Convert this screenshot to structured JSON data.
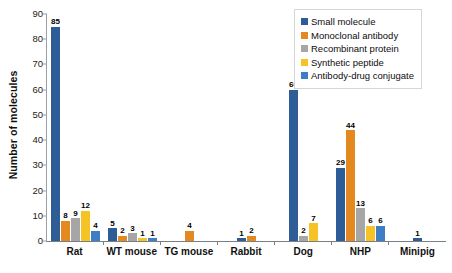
{
  "chart_data": {
    "type": "bar",
    "title": "",
    "xlabel": "",
    "ylabel": "Number of molecules",
    "ylim": [
      0,
      90
    ],
    "yticks": [
      0,
      10,
      20,
      30,
      40,
      50,
      60,
      70,
      80,
      90
    ],
    "grid": false,
    "legend_position": "top-right",
    "categories": [
      "Rat",
      "WT mouse",
      "TG mouse",
      "Rabbit",
      "Dog",
      "NHP",
      "Minipig"
    ],
    "series": [
      {
        "name": "Small molecule",
        "color": "#2e5c96",
        "values": [
          85,
          5,
          null,
          1,
          60,
          29,
          1
        ]
      },
      {
        "name": "Monoclonal antibody",
        "color": "#e3891f",
        "values": [
          8,
          2,
          4,
          2,
          null,
          44,
          null
        ]
      },
      {
        "name": "Recombinant protein",
        "color": "#a6a6a6",
        "values": [
          9,
          3,
          null,
          null,
          2,
          13,
          null
        ]
      },
      {
        "name": "Synthetic peptide",
        "color": "#f5c325",
        "values": [
          12,
          1,
          null,
          null,
          7,
          6,
          null
        ]
      },
      {
        "name": "Antibody-drug conjugate",
        "color": "#3e7ec4",
        "values": [
          4,
          1,
          null,
          null,
          null,
          6,
          null
        ]
      }
    ]
  },
  "legend": {
    "items": [
      {
        "label": "Small molecule",
        "color": "#2e5c96"
      },
      {
        "label": "Monoclonal antibody",
        "color": "#e3891f"
      },
      {
        "label": "Recombinant protein",
        "color": "#a6a6a6"
      },
      {
        "label": "Synthetic peptide",
        "color": "#f5c325"
      },
      {
        "label": "Antibody-drug conjugate",
        "color": "#3e7ec4"
      }
    ]
  }
}
